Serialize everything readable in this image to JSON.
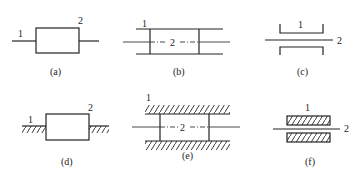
{
  "figure": {
    "panels": [
      {
        "id": "a",
        "caption": "(a)",
        "labels": {
          "body_1": "1",
          "body_2": "2"
        },
        "type": "free-block-on-line"
      },
      {
        "id": "b",
        "caption": "(b)",
        "labels": {
          "body_1": "1",
          "body_2": "2"
        },
        "type": "slider-in-guide"
      },
      {
        "id": "c",
        "caption": "(c)",
        "labels": {
          "body_1": "1",
          "body_2": "2"
        },
        "type": "rod-through-bracket"
      },
      {
        "id": "d",
        "caption": "(d)",
        "labels": {
          "body_1": "1",
          "body_2": "2"
        },
        "type": "block-on-ground"
      },
      {
        "id": "e",
        "caption": "(e)",
        "labels": {
          "body_1": "1",
          "body_2": "2"
        },
        "type": "slider-in-fixed-guide"
      },
      {
        "id": "f",
        "caption": "(f)",
        "labels": {
          "body_1": "1",
          "body_2": "2"
        },
        "type": "rod-through-fixed-guide"
      }
    ]
  }
}
